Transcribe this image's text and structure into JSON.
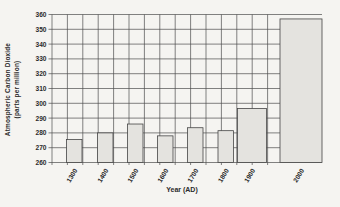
{
  "chart": {
    "x_title": "Year (AD)",
    "y_title_line1": "Atmospheric Carbon Dioxide",
    "y_title_line2": "(parts per million)"
  },
  "chart_data": {
    "type": "bar",
    "title": "",
    "xlabel": "Year (AD)",
    "ylabel": "Atmospheric Carbon Dioxide (parts per million)",
    "categories": [
      "1300",
      "1400",
      "1500",
      "1600",
      "1700",
      "1800",
      "1900",
      "2000"
    ],
    "values": [
      275.5,
      280,
      286,
      278,
      283.5,
      281.5,
      296.5,
      357
    ],
    "ylim": [
      260,
      360
    ],
    "y_ticks": [
      260,
      270,
      280,
      290,
      300,
      310,
      320,
      330,
      340,
      350,
      360
    ],
    "grid": "both",
    "legend": "none",
    "bar_color": "#e4e3df",
    "bar_stroke": "#454545",
    "grid_color": "#4d4d4d",
    "text_color": "#2b2b2b",
    "background": "#f5f4f1",
    "plot": {
      "left": 52,
      "right": 322,
      "top": 14.5,
      "bottom": 162.5,
      "v_grid_pitch": 15.4,
      "v_grid_end": 278
    },
    "bar_slots": [
      {
        "x": 66.5,
        "w": 15.5
      },
      {
        "x": 97.5,
        "w": 15.5
      },
      {
        "x": 127.5,
        "w": 15.5
      },
      {
        "x": 157.5,
        "w": 15.5
      },
      {
        "x": 187.5,
        "w": 15.5
      },
      {
        "x": 218.0,
        "w": 15.5
      },
      {
        "x": 237.5,
        "w": 29.0
      },
      {
        "x": 280.0,
        "w": 42.0
      }
    ]
  }
}
